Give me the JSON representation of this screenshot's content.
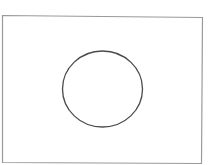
{
  "diagram": {
    "background": "#ffffff",
    "frame": {
      "shape": "rectangle",
      "stroke": "#9a9a9a",
      "points": "2.5,15.5 202.5,17.5 201.5,163.5 2.5,162.5"
    },
    "circle": {
      "shape": "circle",
      "stroke": "#4a4a4a",
      "cx": 102.5,
      "cy": 89,
      "rx": 40,
      "ry": 38
    }
  }
}
